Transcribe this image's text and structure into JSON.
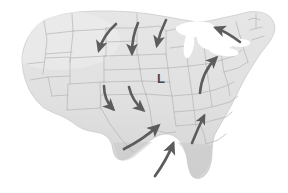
{
  "figure": {
    "name": "us-weather-map",
    "background_color": "#ffffff"
  },
  "map": {
    "name": "united-states-outline",
    "land_fill": "#e2e2e2",
    "land_fill_shadow": "#cfcfcf",
    "border_color": "#b9b9b9",
    "outline_color": "#c6c6c6",
    "lakes_fill": "#ffffff",
    "lakes_name": "great-lakes"
  },
  "pressure_centers": [
    {
      "id": "low-1",
      "label": "L",
      "type": "low",
      "color": "#4a4a4a",
      "x": 161,
      "y": 82
    }
  ],
  "wind_arrows": {
    "color": "#5c5c5c",
    "description": "Counterclockwise cyclonic inflow arrows around the low pressure center",
    "count": 9,
    "items": [
      {
        "id": "arrow-nw-plains",
        "label": "northwest plains inflow",
        "direction": "south-southeast"
      },
      {
        "id": "arrow-n-dakotas",
        "label": "northern dakotas inflow",
        "direction": "south"
      },
      {
        "id": "arrow-n-minnesota",
        "label": "minnesota inflow",
        "direction": "south-southeast"
      },
      {
        "id": "arrow-ne-outflow",
        "label": "northeast outflow",
        "direction": "northwest"
      },
      {
        "id": "arrow-ohio-valley",
        "label": "ohio valley inflow",
        "direction": "north-northeast"
      },
      {
        "id": "arrow-colorado",
        "label": "colorado inflow",
        "direction": "southeast"
      },
      {
        "id": "arrow-kansas",
        "label": "kansas inflow",
        "direction": "southeast"
      },
      {
        "id": "arrow-texas-gulf",
        "label": "texas gulf inflow",
        "direction": "northeast"
      },
      {
        "id": "arrow-mississippi",
        "label": "mississippi valley inflow",
        "direction": "north"
      },
      {
        "id": "arrow-southeast-gulf",
        "label": "southeast gulf inflow",
        "direction": "north-northeast"
      }
    ]
  }
}
